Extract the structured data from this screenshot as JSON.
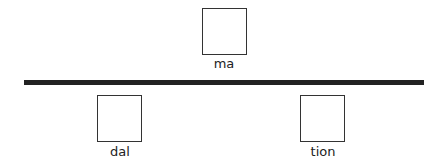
{
  "diagram": {
    "top": {
      "boxes": [
        {
          "label": "ma"
        }
      ]
    },
    "divider": {
      "color": "#222222"
    },
    "bottom": {
      "boxes": [
        {
          "label": "dal"
        },
        {
          "label": "tion"
        }
      ]
    }
  }
}
